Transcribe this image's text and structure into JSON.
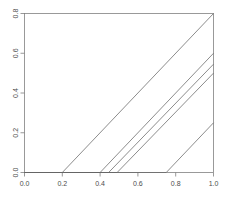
{
  "chart_data": {
    "type": "line",
    "title": "",
    "subtitle": "",
    "xlabel": "",
    "ylabel": "",
    "xlim": [
      0.0,
      1.0
    ],
    "ylim": [
      0.0,
      0.8
    ],
    "grid": false,
    "legend": false,
    "legend_position": "none",
    "x_ticks": [
      0.0,
      0.2,
      0.4,
      0.6,
      0.8,
      1.0
    ],
    "x_tick_labels": [
      "0.0",
      "0.2",
      "0.4",
      "0.6",
      "0.8",
      "1.0"
    ],
    "y_ticks": [
      0.0,
      0.2,
      0.4,
      0.6,
      0.8
    ],
    "y_tick_labels": [
      "0.0",
      "0.2",
      "0.4",
      "0.6",
      "0.8"
    ],
    "line_color": "#666666",
    "axis_color": "#7f7f7f",
    "background_color": "#ffffff",
    "series": [
      {
        "name": "curve-1",
        "breakpoint": 0.2,
        "end_value": 0.8,
        "x": [
          0.0,
          0.2,
          1.0
        ],
        "values": [
          0.0,
          0.0,
          0.8
        ]
      },
      {
        "name": "curve-2",
        "breakpoint": 0.4,
        "end_value": 0.6,
        "x": [
          0.0,
          0.4,
          1.0
        ],
        "values": [
          0.0,
          0.0,
          0.6
        ]
      },
      {
        "name": "curve-3",
        "breakpoint": 0.445,
        "end_value": 0.545,
        "x": [
          0.0,
          0.445,
          1.0
        ],
        "values": [
          0.0,
          0.0,
          0.545
        ]
      },
      {
        "name": "curve-4",
        "breakpoint": 0.49,
        "end_value": 0.5,
        "x": [
          0.0,
          0.49,
          1.0
        ],
        "values": [
          0.0,
          0.0,
          0.5
        ]
      },
      {
        "name": "curve-5",
        "breakpoint": 0.75,
        "end_value": 0.25,
        "x": [
          0.0,
          0.75,
          1.0
        ],
        "values": [
          0.0,
          0.0,
          0.25
        ]
      }
    ]
  }
}
